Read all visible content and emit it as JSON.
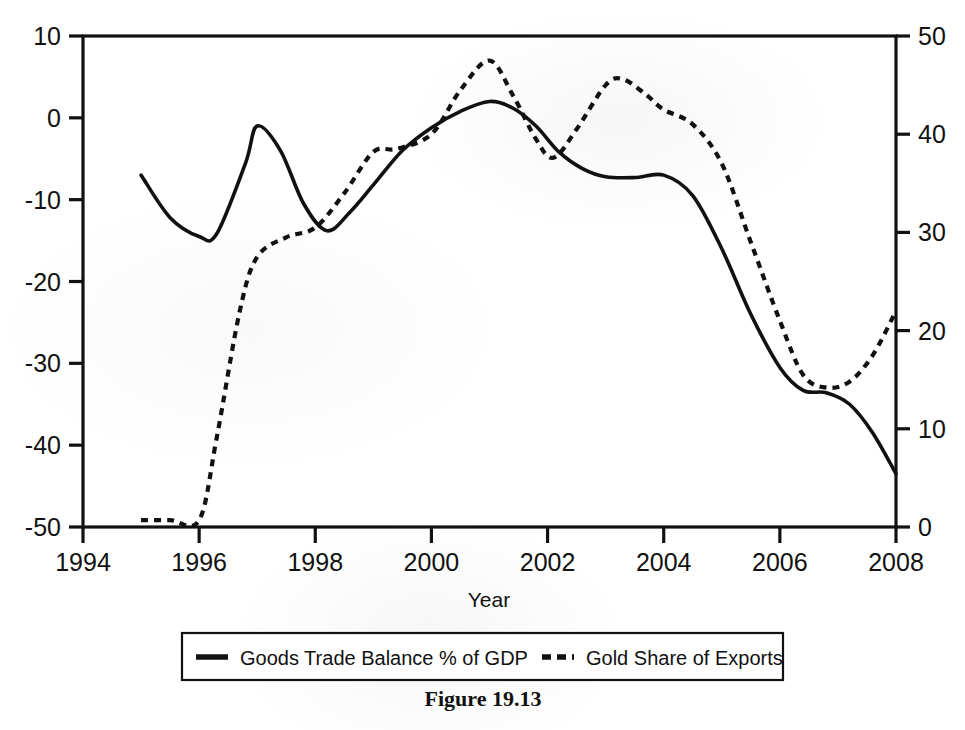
{
  "figure": {
    "caption": "Figure 19.13"
  },
  "chart_data": {
    "type": "line",
    "title": "",
    "xlabel": "Year",
    "ylabel": "",
    "ylabel_right": "",
    "grid": false,
    "legend_position": "bottom",
    "xlim": [
      1994,
      2008
    ],
    "xticks": [
      "1994",
      "1996",
      "1998",
      "2000",
      "2002",
      "2004",
      "2006",
      "2008"
    ],
    "xtick_values": [
      1994,
      1996,
      1998,
      2000,
      2002,
      2004,
      2006,
      2008
    ],
    "ylim_left": [
      -50,
      10
    ],
    "yticks_left": [
      "10",
      "0",
      "-10",
      "-20",
      "-30",
      "-40",
      "-50"
    ],
    "ytick_values_left": [
      10,
      0,
      -10,
      -20,
      -30,
      -40,
      -50
    ],
    "ylim_right": [
      0,
      50
    ],
    "yticks_right": [
      "50",
      "40",
      "30",
      "20",
      "10",
      "0"
    ],
    "ytick_values_right": [
      50,
      40,
      30,
      20,
      10,
      0
    ],
    "series": [
      {
        "name": "Goods Trade Balance % of GDP",
        "style": "solid",
        "axis": "left",
        "color": "#111111",
        "x": [
          1995.0,
          1995.5,
          1996.0,
          1996.3,
          1996.8,
          1997.0,
          1997.4,
          1997.8,
          1998.2,
          1998.6,
          1999.0,
          1999.5,
          2000.0,
          2000.5,
          2001.0,
          2001.4,
          2001.8,
          2002.2,
          2002.6,
          2003.0,
          2003.5,
          2004.0,
          2004.5,
          2005.0,
          2005.5,
          2006.0,
          2006.4,
          2006.8,
          2007.2,
          2007.6,
          2008.0
        ],
        "y": [
          -7.0,
          -12.2,
          -14.5,
          -14.2,
          -5.5,
          -1.0,
          -4.0,
          -10.5,
          -13.8,
          -11.5,
          -8.2,
          -4.0,
          -1.2,
          0.8,
          2.0,
          1.2,
          -1.0,
          -4.2,
          -6.2,
          -7.2,
          -7.3,
          -7.0,
          -9.5,
          -16.0,
          -24.0,
          -30.5,
          -33.3,
          -33.6,
          -35.0,
          -38.5,
          -43.5
        ]
      },
      {
        "name": "Gold Share of Exports",
        "style": "dashed",
        "axis": "right",
        "color": "#111111",
        "x": [
          1995.0,
          1995.5,
          1996.0,
          1996.3,
          1996.7,
          1997.0,
          1997.5,
          1998.0,
          1998.5,
          1999.0,
          1999.4,
          2000.0,
          2000.5,
          2001.0,
          2001.4,
          2001.8,
          2002.1,
          2002.5,
          2003.0,
          2003.3,
          2003.7,
          2004.0,
          2004.5,
          2005.0,
          2005.5,
          2006.0,
          2006.4,
          2006.8,
          2007.2,
          2007.6,
          2008.0
        ],
        "y": [
          0.7,
          0.7,
          0.7,
          9.0,
          22.0,
          27.5,
          29.5,
          30.5,
          34.0,
          38.2,
          38.5,
          40.0,
          44.5,
          47.5,
          44.0,
          39.5,
          37.6,
          40.5,
          45.0,
          45.6,
          44.0,
          42.5,
          41.0,
          37.0,
          29.0,
          21.0,
          15.5,
          14.2,
          14.8,
          17.5,
          22.0
        ]
      }
    ],
    "legend_entries": [
      {
        "label": "Goods Trade Balance % of GDP",
        "style": "solid"
      },
      {
        "label": "Gold Share of Exports",
        "style": "dashed"
      }
    ]
  }
}
